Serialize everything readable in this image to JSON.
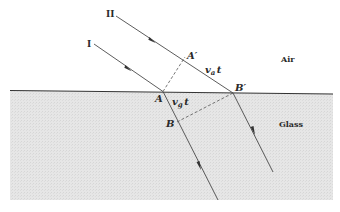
{
  "figure": {
    "media": {
      "upper": {
        "label": "Air",
        "color": "#ffffff"
      },
      "lower": {
        "label": "Glass",
        "color": "#e6e6e6"
      }
    },
    "rays": [
      {
        "id": "ray-I",
        "label": "I"
      },
      {
        "id": "ray-II",
        "label": "II"
      }
    ],
    "points": {
      "A": "A",
      "A_prime": "A′",
      "B": "B",
      "B_prime": "B′"
    },
    "distances": {
      "air": "vₐt",
      "air_base": "v",
      "air_sub": "a",
      "air_t": "t",
      "glass_base": "v",
      "glass_sub": "g",
      "glass_t": "t"
    },
    "colors": {
      "line": "#4a4a4a",
      "surface": "#333333",
      "glass_fill": "#e4e4e4"
    }
  }
}
